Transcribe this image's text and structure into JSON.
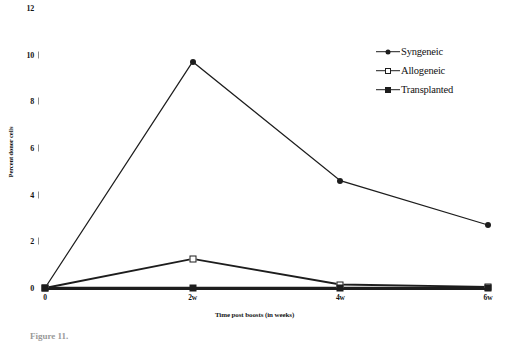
{
  "chart_data": {
    "type": "line",
    "title": "",
    "xlabel": "Time post boosts (in weeks)",
    "ylabel": "Percent donor cells",
    "categories": [
      "0",
      "2w",
      "4w",
      "6w"
    ],
    "x": [
      0,
      2,
      4,
      6
    ],
    "xlim": [
      0,
      6
    ],
    "ylim": [
      0,
      12
    ],
    "y_ticks": [
      0,
      2,
      4,
      6,
      8,
      10,
      12
    ],
    "y_tick_labels": [
      "0",
      "2",
      "4",
      "6",
      "8",
      "10",
      "12"
    ],
    "grid": false,
    "legend_position": "top-right",
    "series": [
      {
        "name": "Syngeneic",
        "marker": "filled-circle",
        "values": [
          0,
          9.7,
          4.6,
          2.7
        ]
      },
      {
        "name": "Allogeneic",
        "marker": "open-square",
        "values": [
          0,
          1.25,
          0.15,
          0.05
        ]
      },
      {
        "name": "Transplanted",
        "marker": "filled-square",
        "values": [
          0,
          0,
          0,
          0
        ]
      }
    ]
  },
  "axes": {
    "y_title": "Percent donor cells",
    "x_title": "Time post boosts (in weeks)",
    "y_labels": [
      "12",
      "10",
      "8",
      "6",
      "4",
      "2",
      "0"
    ],
    "x_labels": [
      "0",
      "2w",
      "4w",
      "6w"
    ]
  },
  "legend": {
    "items": [
      {
        "label": "Syngeneic",
        "marker": "filled-circle"
      },
      {
        "label": "Allogeneic",
        "marker": "open-square"
      },
      {
        "label": "Transplanted",
        "marker": "filled-square"
      }
    ]
  },
  "caption": {
    "text": "Figure 11."
  }
}
